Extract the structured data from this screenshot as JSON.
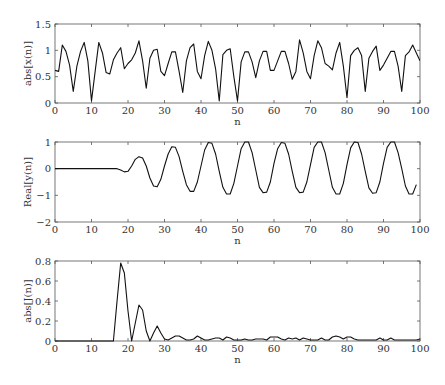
{
  "chart_data": [
    {
      "type": "line",
      "title": "",
      "xlabel": "n",
      "ylabel": "abs[x(n)]",
      "xlim": [
        0,
        100
      ],
      "ylim": [
        0,
        1.5
      ],
      "xticks": [
        0,
        10,
        20,
        30,
        40,
        50,
        60,
        70,
        80,
        90,
        100
      ],
      "yticks": [
        0,
        0.5,
        1,
        1.5
      ],
      "ytick_labels": [
        "0",
        "0.5",
        "1",
        "1.5"
      ],
      "grid": false,
      "x": [
        0,
        1,
        2,
        3,
        4,
        5,
        6,
        7,
        8,
        9,
        10,
        11,
        12,
        13,
        14,
        15,
        16,
        17,
        18,
        19,
        20,
        21,
        22,
        23,
        24,
        25,
        26,
        27,
        28,
        29,
        30,
        31,
        32,
        33,
        34,
        35,
        36,
        37,
        38,
        39,
        40,
        41,
        42,
        43,
        44,
        45,
        46,
        47,
        48,
        49,
        50,
        51,
        52,
        53,
        54,
        55,
        56,
        57,
        58,
        59,
        60,
        61,
        62,
        63,
        64,
        65,
        66,
        67,
        68,
        69,
        70,
        71,
        72,
        73,
        74,
        75,
        76,
        77,
        78,
        79,
        80,
        81,
        82,
        83,
        84,
        85,
        86,
        87,
        88,
        89,
        90,
        91,
        92,
        93,
        94,
        95,
        96,
        97,
        98,
        99,
        100
      ],
      "values": [
        0.62,
        0.6,
        1.1,
        0.98,
        0.72,
        0.22,
        0.7,
        0.98,
        1.15,
        0.8,
        0.04,
        0.6,
        1.15,
        0.95,
        0.58,
        0.55,
        0.82,
        0.95,
        1.05,
        0.65,
        0.75,
        0.82,
        0.95,
        1.18,
        0.8,
        0.28,
        0.85,
        1.0,
        1.02,
        0.6,
        0.52,
        0.75,
        0.97,
        0.97,
        0.6,
        0.2,
        0.8,
        1.05,
        1.12,
        0.6,
        0.46,
        0.9,
        1.17,
        1.0,
        0.65,
        0.04,
        0.92,
        1.0,
        1.03,
        0.5,
        0.04,
        0.78,
        0.97,
        0.97,
        0.78,
        0.48,
        0.8,
        0.98,
        0.98,
        0.62,
        0.62,
        0.8,
        0.98,
        0.98,
        0.75,
        0.45,
        0.6,
        1.2,
        0.95,
        0.6,
        0.46,
        0.9,
        1.18,
        1.05,
        0.75,
        0.7,
        0.63,
        0.95,
        1.15,
        0.7,
        0.1,
        0.9,
        1.0,
        1.05,
        0.9,
        0.22,
        0.85,
        0.98,
        1.08,
        0.62,
        0.72,
        0.85,
        0.98,
        0.98,
        0.7,
        0.22,
        0.9,
        0.97,
        1.1,
        0.95,
        0.8
      ]
    },
    {
      "type": "line",
      "title": "",
      "xlabel": "n",
      "ylabel": "Real[y(n)]",
      "xlim": [
        0,
        100
      ],
      "ylim": [
        -2,
        1
      ],
      "xticks": [
        0,
        10,
        20,
        30,
        40,
        50,
        60,
        70,
        80,
        90,
        100
      ],
      "yticks": [
        -2,
        -1,
        0,
        1
      ],
      "ytick_labels": [
        "-2",
        "-1",
        "0",
        "1"
      ],
      "grid": false,
      "x": [
        0,
        17,
        18,
        19,
        20,
        21,
        22,
        23,
        24,
        25,
        26,
        27,
        28,
        29,
        30,
        31,
        32,
        33,
        34,
        35,
        36,
        37,
        38,
        39,
        40,
        41,
        42,
        43,
        44,
        45,
        46,
        47,
        48,
        49,
        50,
        51,
        52,
        53,
        54,
        55,
        56,
        57,
        58,
        59,
        60,
        61,
        62,
        63,
        64,
        65,
        66,
        67,
        68,
        69,
        70,
        71,
        72,
        73,
        74,
        75,
        76,
        77,
        78,
        79,
        80,
        81,
        82,
        83,
        84,
        85,
        86,
        87,
        88,
        89,
        90,
        91,
        92,
        93,
        94,
        95,
        96,
        97,
        98,
        99,
        100
      ],
      "values": [
        0,
        0,
        -0.05,
        -0.12,
        -0.1,
        0.1,
        0.35,
        0.45,
        0.4,
        0.1,
        -0.35,
        -0.65,
        -0.68,
        -0.4,
        0.1,
        0.55,
        0.82,
        0.8,
        0.45,
        -0.1,
        -0.6,
        -0.85,
        -0.85,
        -0.5,
        0.1,
        0.7,
        0.98,
        0.95,
        0.55,
        -0.1,
        -0.7,
        -0.95,
        -0.95,
        -0.55,
        0.1,
        0.75,
        1.0,
        1.0,
        0.6,
        -0.05,
        -0.7,
        -0.9,
        -0.88,
        -0.5,
        0.2,
        0.75,
        0.98,
        0.95,
        0.55,
        -0.1,
        -0.7,
        -0.9,
        -0.88,
        -0.5,
        0.15,
        0.8,
        1.0,
        1.0,
        0.6,
        -0.05,
        -0.7,
        -0.95,
        -0.95,
        -0.55,
        0.15,
        0.78,
        1.0,
        0.98,
        0.55,
        -0.1,
        -0.72,
        -0.92,
        -0.9,
        -0.5,
        0.2,
        0.8,
        1.0,
        1.0,
        0.6,
        0.0,
        -0.65,
        -0.95,
        -0.95,
        -0.6
      ]
    },
    {
      "type": "line",
      "title": "",
      "xlabel": "n",
      "ylabel": "abs[J(n)]",
      "xlim": [
        0,
        100
      ],
      "ylim": [
        0,
        0.8
      ],
      "xticks": [
        0,
        10,
        20,
        30,
        40,
        50,
        60,
        70,
        80,
        90,
        100
      ],
      "yticks": [
        0,
        0.2,
        0.4,
        0.6,
        0.8
      ],
      "ytick_labels": [
        "0",
        "0.2",
        "0.4",
        "0.6",
        "0.8"
      ],
      "grid": false,
      "x": [
        0,
        16,
        17,
        18,
        19,
        20,
        21,
        22,
        23,
        24,
        25,
        26,
        27,
        28,
        29,
        30,
        31,
        32,
        33,
        34,
        35,
        36,
        37,
        38,
        39,
        40,
        41,
        42,
        43,
        44,
        45,
        46,
        47,
        48,
        49,
        50,
        51,
        52,
        53,
        54,
        55,
        56,
        57,
        58,
        59,
        60,
        61,
        62,
        63,
        64,
        65,
        66,
        67,
        68,
        69,
        70,
        71,
        72,
        73,
        74,
        75,
        76,
        77,
        78,
        79,
        80,
        81,
        82,
        83,
        84,
        85,
        86,
        87,
        88,
        89,
        90,
        91,
        92,
        93,
        94,
        95,
        96,
        97,
        98,
        99,
        100
      ],
      "values": [
        0,
        0,
        0.4,
        0.78,
        0.68,
        0.3,
        0.0,
        0.18,
        0.36,
        0.31,
        0.1,
        0.0,
        0.08,
        0.15,
        0.08,
        0.02,
        0.01,
        0.03,
        0.05,
        0.05,
        0.03,
        0.01,
        0.01,
        0.02,
        0.05,
        0.03,
        0.01,
        0.01,
        0.02,
        0.03,
        0.03,
        0.01,
        0.04,
        0.03,
        0.01,
        0.01,
        0.01,
        0.02,
        0.01,
        0.01,
        0.02,
        0.02,
        0.02,
        0.01,
        0.04,
        0.04,
        0.04,
        0.02,
        0.01,
        0.03,
        0.02,
        0.03,
        0.01,
        0.03,
        0.02,
        0.01,
        0.01,
        0.01,
        0.03,
        0.01,
        0.01,
        0.04,
        0.05,
        0.04,
        0.02,
        0.04,
        0.04,
        0.02,
        0.01,
        0.01,
        0.01,
        0.01,
        0.01,
        0.01,
        0.03,
        0.01,
        0.01,
        0.03,
        0.01,
        0.01,
        0.01,
        0.01,
        0.01,
        0.01,
        0.01,
        0.02
      ]
    }
  ],
  "subplots": [
    {
      "ylabel": "abs[x(n)]",
      "xlabel": "n"
    },
    {
      "ylabel": "Real[y(n)]",
      "xlabel": "n"
    },
    {
      "ylabel": "abs[J(n)]",
      "xlabel": "n"
    }
  ]
}
